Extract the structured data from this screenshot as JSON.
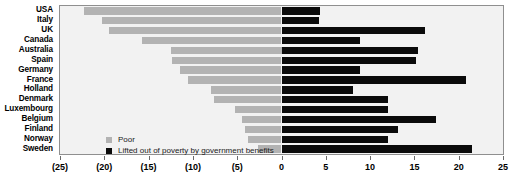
{
  "chart_data": {
    "type": "bar",
    "orientation": "horizontal",
    "stacked": "diverging",
    "title": "",
    "subtitle": "",
    "xlabel": "",
    "ylabel": "",
    "xlim": [
      -25,
      25
    ],
    "grid": false,
    "legend_position": "inside-bottom-left",
    "x_ticks": [
      -25,
      -20,
      -15,
      -10,
      -5,
      0,
      5,
      10,
      15,
      20,
      25
    ],
    "x_tick_labels": [
      "(25)",
      "(20)",
      "(15)",
      "(10)",
      "(5)",
      "0",
      "5",
      "10",
      "15",
      "20",
      "25"
    ],
    "categories": [
      "USA",
      "Italy",
      "UK",
      "Canada",
      "Australia",
      "Spain",
      "Germany",
      "France",
      "Holland",
      "Denmark",
      "Luxembourg",
      "Belgium",
      "Finland",
      "Norway",
      "Sweden"
    ],
    "series": [
      {
        "name": "Poor",
        "color": "#b3b3b3",
        "values": [
          -22.3,
          -20.3,
          -19.5,
          -15.8,
          -12.5,
          -12.4,
          -11.5,
          -10.5,
          -8.0,
          -7.6,
          -5.2,
          -4.5,
          -4.1,
          -3.8,
          -2.6
        ]
      },
      {
        "name": "Lifted out of poverty by government benefits",
        "color": "#0b0b0b",
        "values": [
          4.4,
          4.2,
          16.2,
          8.9,
          15.4,
          15.2,
          8.9,
          20.8,
          8.1,
          12.0,
          12.0,
          17.4,
          13.2,
          12.0,
          21.5
        ]
      }
    ]
  },
  "legend": {
    "items": [
      {
        "label": "Poor",
        "swatch": "poor"
      },
      {
        "label": "Lifted out of poverty by government benefits",
        "swatch": "lifted"
      }
    ]
  },
  "colors": {
    "poor": "#b3b3b3",
    "lifted": "#0b0b0b",
    "plot_background": "#f2f2f2",
    "plot_border": "#8f8f8f",
    "page_background": "#ffffff",
    "text": "#000000"
  }
}
